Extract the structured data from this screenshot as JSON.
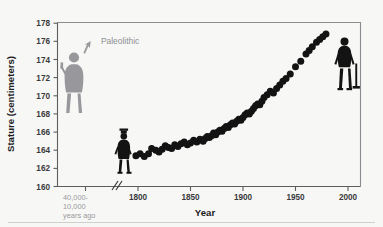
{
  "chart_data": {
    "type": "scatter",
    "title": "",
    "xlabel": "Year",
    "ylabel": "Stature (centimeters)",
    "xlim": [
      1780,
      2000
    ],
    "ylim": [
      160,
      178
    ],
    "grid": false,
    "legend_position": "none",
    "y_ticks": [
      160,
      162,
      164,
      166,
      168,
      170,
      172,
      174,
      176,
      178
    ],
    "x_ticks": [
      1800,
      1850,
      1900,
      1950,
      2000
    ],
    "x_tick_labels": [
      "1800",
      "1850",
      "1900",
      "1950",
      "2000"
    ],
    "y_tick_labels": [
      "160",
      "162",
      "164",
      "166",
      "168",
      "170",
      "172",
      "174",
      "176",
      "178"
    ],
    "axis_break": true,
    "paleolithic_tick_label": "40,000-\n10,000\nyears ago",
    "paleolithic_tick_lines": [
      "40,000-",
      "10,000",
      "years ago"
    ],
    "paleolithic_value": 170.5,
    "annotations": [
      {
        "text": "Paleolithic",
        "target": "paleolithic-figure",
        "style": "gray-arrow"
      }
    ],
    "series": [
      {
        "name": "Mean male stature",
        "color": "#131314",
        "x": [
          1798,
          1802,
          1806,
          1810,
          1813,
          1817,
          1820,
          1823,
          1826,
          1829,
          1832,
          1835,
          1838,
          1841,
          1844,
          1847,
          1850,
          1853,
          1856,
          1859,
          1862,
          1864,
          1866,
          1868,
          1870,
          1872,
          1874,
          1876,
          1878,
          1880,
          1882,
          1884,
          1886,
          1888,
          1890,
          1892,
          1894,
          1896,
          1898,
          1900,
          1902,
          1904,
          1906,
          1908,
          1910,
          1912,
          1914,
          1916,
          1918,
          1920,
          1923,
          1926,
          1929,
          1932,
          1935,
          1938,
          1941,
          1945,
          1950,
          1955,
          1960,
          1963,
          1966,
          1970,
          1973,
          1976,
          1979
        ],
        "y": [
          163.4,
          163.6,
          163.3,
          163.6,
          164.2,
          164.0,
          163.8,
          164.1,
          164.5,
          164.3,
          164.2,
          164.6,
          164.4,
          164.7,
          164.9,
          164.6,
          164.8,
          165.1,
          164.9,
          165.2,
          165.0,
          165.3,
          165.5,
          165.4,
          165.6,
          165.9,
          165.7,
          166.0,
          166.2,
          166.1,
          166.4,
          166.6,
          166.5,
          166.8,
          167.0,
          166.9,
          167.2,
          167.4,
          167.3,
          167.6,
          167.9,
          168.1,
          168.0,
          168.3,
          168.6,
          168.9,
          169.1,
          169.0,
          169.4,
          169.8,
          170.1,
          170.5,
          170.3,
          170.8,
          171.2,
          171.6,
          171.9,
          172.4,
          173.2,
          173.8,
          174.6,
          175.0,
          175.4,
          175.9,
          176.2,
          176.5,
          176.8
        ]
      }
    ]
  },
  "figures": [
    {
      "name": "paleolithic-figure",
      "label": "Paleolithic",
      "color": "#98989c"
    },
    {
      "name": "nineteenth-century-figure",
      "label": "",
      "color": "#131314"
    },
    {
      "name": "modern-figure",
      "label": "",
      "color": "#131314"
    }
  ]
}
